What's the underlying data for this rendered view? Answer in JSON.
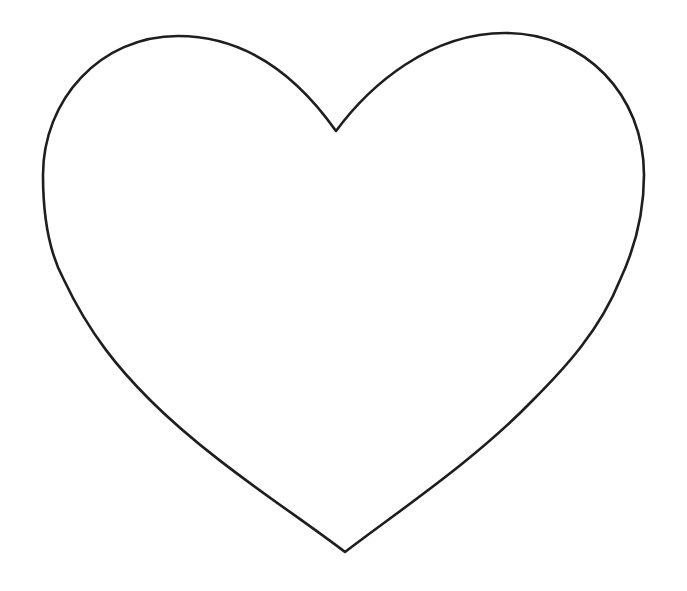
{
  "figure": {
    "shape": "heart-outline",
    "stroke_color": "#1e1e1e",
    "fill_color": "#ffffff",
    "background_color": "#ffffff",
    "stroke_width": 2.6
  }
}
